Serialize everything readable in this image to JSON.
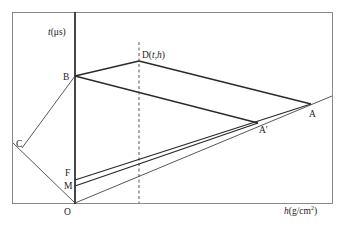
{
  "diagram": {
    "axes": {
      "y_label_var": "t",
      "y_label_unit": "(μs)",
      "x_label_var": "h",
      "x_label_unit": "(g/cm",
      "x_label_sup": "2",
      "x_label_close": ")"
    },
    "points": {
      "O": "O",
      "B": "B",
      "C": "C",
      "F": "F",
      "M": "M",
      "A": "A",
      "A_prime": "A'",
      "D_prefix": "D(",
      "D_t": "t",
      "D_sep": ",",
      "D_h": "h",
      "D_suffix": ")"
    },
    "colors": {
      "line": "#2a2a2a",
      "frame": "#8a8a8a",
      "background": "#ffffff"
    }
  }
}
